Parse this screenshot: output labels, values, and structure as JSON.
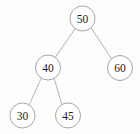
{
  "figure": {
    "background_color": "#fdfdfc",
    "node_fill": "#ffffff",
    "node_stroke": "#9a9a9a",
    "edge_stroke": "#a9a9a9",
    "label_color": "#1c1c1c"
  },
  "chart_data": {
    "type": "diagram",
    "title": "",
    "nodes": [
      {
        "id": "n50",
        "label": "50",
        "cx": 82.5,
        "cy": 18.5,
        "r": 12.5
      },
      {
        "id": "n40",
        "label": "40",
        "cx": 48.0,
        "cy": 67.5,
        "r": 12.5
      },
      {
        "id": "n60",
        "label": "60",
        "cx": 120.0,
        "cy": 68.0,
        "r": 12.5
      },
      {
        "id": "n30",
        "label": "30",
        "cx": 22.5,
        "cy": 115.5,
        "r": 12.5
      },
      {
        "id": "n45",
        "label": "45",
        "cx": 68.0,
        "cy": 115.5,
        "r": 12.5
      }
    ],
    "edges": [
      {
        "from": "n50",
        "to": "n40",
        "x1": 75.2,
        "y1": 28.6,
        "x2": 55.3,
        "y2": 57.4
      },
      {
        "from": "n50",
        "to": "n60",
        "x1": 91.0,
        "y1": 27.7,
        "x2": 111.6,
        "y2": 58.8
      },
      {
        "from": "n40",
        "to": "n30",
        "x1": 41.3,
        "y1": 78.1,
        "x2": 29.2,
        "y2": 104.9
      },
      {
        "from": "n40",
        "to": "n45",
        "x1": 54.2,
        "y1": 78.4,
        "x2": 61.8,
        "y2": 104.6
      }
    ]
  }
}
